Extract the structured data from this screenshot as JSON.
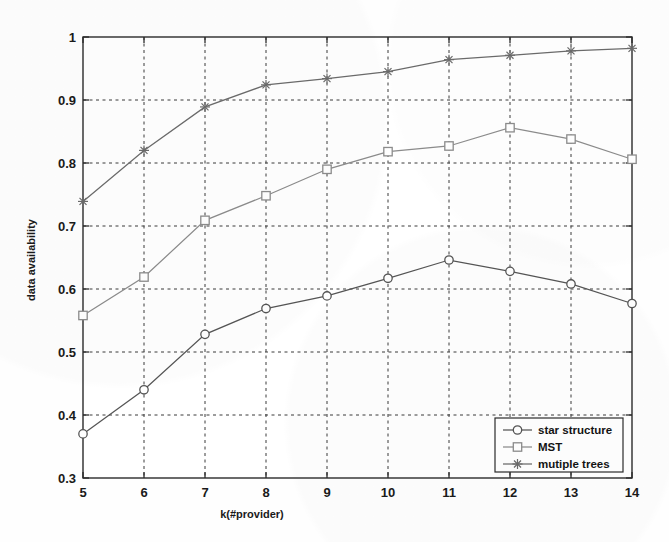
{
  "chart_data": {
    "type": "line",
    "title": "",
    "xlabel": "k(#provider)",
    "ylabel": "data availability",
    "x": [
      5,
      6,
      7,
      8,
      9,
      10,
      11,
      12,
      13,
      14
    ],
    "xtick_labels": [
      "5",
      "6",
      "7",
      "8",
      "9",
      "10",
      "11",
      "12",
      "13",
      "14"
    ],
    "ytick_labels": [
      "0.3",
      "0.4",
      "0.5",
      "0.6",
      "0.7",
      "0.8",
      "0.9",
      "1"
    ],
    "yticks": [
      0.3,
      0.4,
      0.5,
      0.6,
      0.7,
      0.8,
      0.9,
      1.0
    ],
    "xlim": [
      5,
      14
    ],
    "ylim": [
      0.3,
      1.0
    ],
    "grid": true,
    "grid_style": "dashed",
    "legend_position": "lower-right",
    "series": [
      {
        "name": "star structure",
        "marker": "circle",
        "color": "#555555",
        "values": [
          0.37,
          0.44,
          0.528,
          0.569,
          0.589,
          0.617,
          0.646,
          0.628,
          0.608,
          0.577
        ]
      },
      {
        "name": "MST",
        "marker": "square",
        "color": "#8c8c8c",
        "values": [
          0.558,
          0.619,
          0.709,
          0.748,
          0.79,
          0.818,
          0.827,
          0.856,
          0.838,
          0.806
        ]
      },
      {
        "name": "mutiple trees",
        "marker": "star",
        "color": "#6b6b6b",
        "values": [
          0.739,
          0.82,
          0.889,
          0.924,
          0.934,
          0.945,
          0.964,
          0.971,
          0.978,
          0.982
        ]
      }
    ]
  },
  "axes": {
    "y_title": "data availability",
    "x_title": "k(#provider)"
  },
  "legend": {
    "entries": [
      {
        "label": "star structure",
        "marker": "circle-marker-icon"
      },
      {
        "label": "MST",
        "marker": "square-marker-icon"
      },
      {
        "label": "mutiple trees",
        "marker": "star-marker-icon"
      }
    ]
  },
  "colors": {
    "axis": "#2b2b2b",
    "grid": "#3a3a3a",
    "background": "#fefefe",
    "star_structure": "#555555",
    "mst": "#8c8c8c",
    "mutiple_trees": "#6b6b6b"
  },
  "ytick_text": {
    "t0": "0.3",
    "t1": "0.4",
    "t2": "0.5",
    "t3": "0.6",
    "t4": "0.7",
    "t5": "0.8",
    "t6": "0.9",
    "t7": "1"
  },
  "xtick_text": {
    "t0": "5",
    "t1": "6",
    "t2": "7",
    "t3": "8",
    "t4": "9",
    "t5": "10",
    "t6": "11",
    "t7": "12",
    "t8": "13",
    "t9": "14"
  }
}
